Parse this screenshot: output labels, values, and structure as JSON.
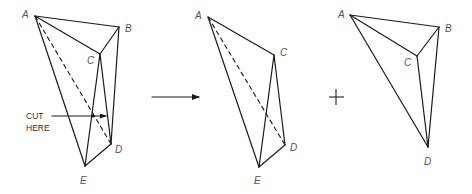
{
  "diagram": {
    "type": "polyhedron-dissection",
    "cut_label_line1": "CUT",
    "cut_label_line2": "HERE",
    "operator_plus": "+",
    "figures": [
      {
        "id": "original",
        "labels": {
          "A": "A",
          "B": "B",
          "C": "C",
          "D": "D",
          "E": "E"
        }
      },
      {
        "id": "piece-ACDE",
        "labels": {
          "A": "A",
          "C": "C",
          "D": "D",
          "E": "E"
        }
      },
      {
        "id": "piece-ABCD",
        "labels": {
          "A": "A",
          "B": "B",
          "C": "C",
          "D": "D"
        }
      }
    ],
    "colors": {
      "line": "#1a1a1a",
      "label": "#555555",
      "background": "#ffffff"
    }
  }
}
